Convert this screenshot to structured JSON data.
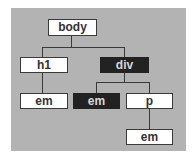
{
  "diagram": {
    "colors": {
      "panel": "#b3b3b3",
      "node_fill": "#ffffff",
      "highlight_fill": "#222222",
      "line": "#3a3a3a"
    },
    "nodes": [
      {
        "id": "body",
        "label": "body",
        "highlighted": false
      },
      {
        "id": "h1",
        "label": "h1",
        "parent": "body",
        "highlighted": false
      },
      {
        "id": "div",
        "label": "div",
        "parent": "body",
        "highlighted": true
      },
      {
        "id": "em1",
        "label": "em",
        "parent": "h1",
        "highlighted": false
      },
      {
        "id": "em2",
        "label": "em",
        "parent": "div",
        "highlighted": true
      },
      {
        "id": "p",
        "label": "p",
        "parent": "div",
        "highlighted": false
      },
      {
        "id": "em3",
        "label": "em",
        "parent": "p",
        "highlighted": false
      }
    ]
  }
}
